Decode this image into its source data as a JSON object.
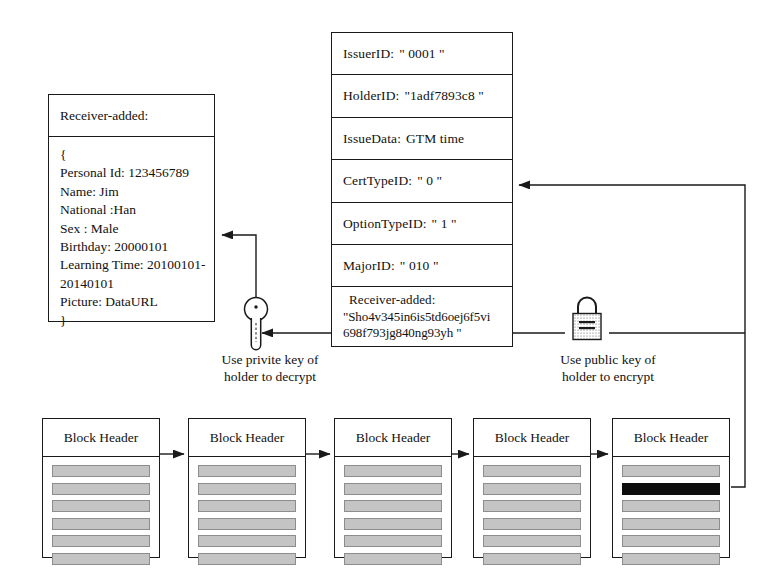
{
  "diagram": {
    "colors": {
      "line": "#1a1a1a",
      "tx_bar": "#c4c4c4",
      "tx_bar_highlight": "#0d0d0d",
      "background": "#ffffff"
    }
  },
  "certificate": {
    "name": "certificate-record",
    "rows": [
      {
        "label": "IssuerID:",
        "value": "\" 0001 \""
      },
      {
        "label": "HolderID:",
        "value": "\"1adf7893c8 \""
      },
      {
        "label": "IssueData:",
        "value": "GTM time"
      },
      {
        "label": "CertTypeID:",
        "value": "\" 0 \""
      },
      {
        "label": "OptionTypeID:",
        "value": "\" 1 \""
      },
      {
        "label": "MajorID:",
        "value": "\" 010 \""
      }
    ],
    "encrypted_row": {
      "label": "Receiver-added:",
      "line1": "\"Sho4v345in6is5td6oej6f5vi",
      "line2": "698f793jg840ng93yh \""
    }
  },
  "receiver": {
    "title": "Receiver-added:",
    "open_brace": "{",
    "fields": [
      "Personal Id: 123456789",
      "Name: Jim",
      "National :Han",
      "Sex : Male",
      "Birthday: 20000101",
      "Learning Time: 20100101-",
      "20140101",
      "Picture: DataURL"
    ],
    "close_brace": "}"
  },
  "captions": {
    "private_key": {
      "line1": "Use  privite key of",
      "line2": "holder to decrypt"
    },
    "public_key": {
      "line1": "Use  public key of",
      "line2": "holder to encrypt"
    }
  },
  "icons": {
    "key": "key-icon",
    "lock": "padlock-icon"
  },
  "blockchain": {
    "header_label": "Block Header",
    "blocks": [
      {
        "id": "block-1",
        "x": 42,
        "bars": [
          0,
          0,
          0,
          0,
          0,
          0
        ]
      },
      {
        "id": "block-2",
        "x": 188,
        "bars": [
          0,
          0,
          0,
          0,
          0,
          0
        ]
      },
      {
        "id": "block-3",
        "x": 334,
        "bars": [
          0,
          0,
          0,
          0,
          0,
          0
        ]
      },
      {
        "id": "block-4",
        "x": 473,
        "bars": [
          0,
          0,
          0,
          0,
          0,
          0
        ]
      },
      {
        "id": "block-5",
        "x": 612,
        "bars": [
          0,
          1,
          0,
          0,
          0,
          0
        ]
      }
    ]
  }
}
